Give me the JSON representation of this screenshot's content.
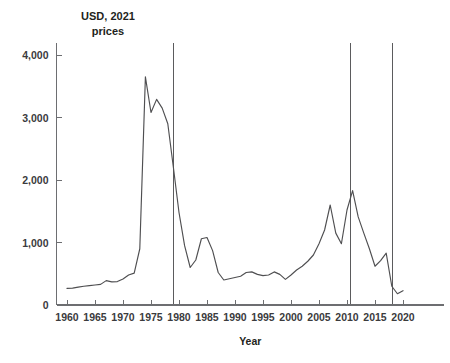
{
  "chart_data": {
    "type": "line",
    "title": "",
    "subtitle": "",
    "unit_label_line1": "USD, 2021",
    "unit_label_line2": "prices",
    "xlabel": "Year",
    "ylabel": "",
    "xlim": [
      1959,
      2021
    ],
    "ylim": [
      0,
      4000
    ],
    "grid": false,
    "legend": null,
    "y_ticks": [
      0,
      1000,
      2000,
      3000,
      4000
    ],
    "y_tick_labels": [
      "0",
      "1,000",
      "2,000",
      "3,000",
      "4,000"
    ],
    "x_ticks": [
      1960,
      1965,
      1970,
      1975,
      1980,
      1985,
      1990,
      1995,
      2000,
      2005,
      2010,
      2015,
      2020
    ],
    "x_tick_labels": [
      "1960",
      "1965",
      "1970",
      "1975",
      "1980",
      "1985",
      "1990",
      "1995",
      "2000",
      "2005",
      "2010",
      "2015",
      "2020"
    ],
    "series": [
      {
        "name": "Real price",
        "color": "#4f4f51",
        "x": [
          1960,
          1961,
          1962,
          1963,
          1964,
          1965,
          1966,
          1967,
          1968,
          1969,
          1970,
          1971,
          1972,
          1973,
          1974,
          1975,
          1976,
          1977,
          1978,
          1979,
          1980,
          1981,
          1982,
          1983,
          1984,
          1985,
          1986,
          1987,
          1988,
          1989,
          1990,
          1991,
          1992,
          1993,
          1994,
          1995,
          1996,
          1997,
          1998,
          1999,
          2000,
          2001,
          2002,
          2003,
          2004,
          2005,
          2006,
          2007,
          2008,
          2009,
          2010,
          2011,
          2012,
          2013,
          2014,
          2015,
          2016,
          2017,
          2018,
          2019,
          2020
        ],
        "y": [
          265,
          270,
          285,
          300,
          310,
          320,
          330,
          390,
          370,
          375,
          415,
          480,
          510,
          900,
          3650,
          3080,
          3290,
          3150,
          2900,
          2200,
          1480,
          950,
          600,
          720,
          1060,
          1080,
          870,
          520,
          400,
          420,
          440,
          460,
          520,
          530,
          490,
          470,
          480,
          530,
          490,
          410,
          480,
          560,
          620,
          700,
          800,
          980,
          1200,
          1600,
          1150,
          980,
          1520,
          1830,
          1410,
          1150,
          900,
          620,
          710,
          830,
          300,
          180,
          230
        ]
      }
    ],
    "vertical_reference_lines": [
      {
        "x": 1979
      },
      {
        "x": 2010.6
      },
      {
        "x": 2018.1
      }
    ]
  }
}
